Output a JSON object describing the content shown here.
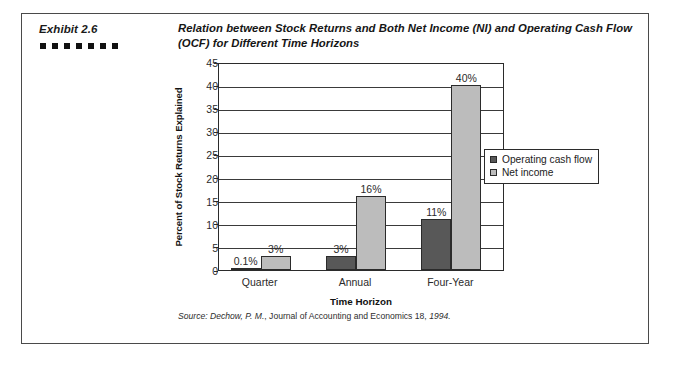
{
  "exhibit": {
    "label": "Exhibit 2.6",
    "dot_count": 7,
    "title": "Relation between Stock Returns and Both Net Income (NI) and Operating Cash Flow (OCF) for Different Time Horizons",
    "source_prefix": "Source:",
    "source_author": "Dechow, P. M.",
    "source_rest": ", Journal of Accounting and Economics 18,",
    "source_year": "1994."
  },
  "colors": {
    "operating_cash_flow": "#585858",
    "net_income": "#bcbcbc",
    "axis": "#2b2b2b",
    "frame": "#4a4a4a"
  },
  "chart_data": {
    "type": "bar",
    "title": "Relation between Stock Returns and Both Net Income (NI) and Operating Cash Flow (OCF) for Different Time Horizons",
    "xlabel": "Time Horizon",
    "ylabel": "Percent of Stock Returns Explained",
    "categories": [
      "Quarter",
      "Annual",
      "Four-Year"
    ],
    "series": [
      {
        "name": "Operating cash flow",
        "color": "#585858",
        "values": [
          0.1,
          3,
          11
        ],
        "labels": [
          "0.1%",
          "3%",
          "11%"
        ]
      },
      {
        "name": "Net income",
        "color": "#bcbcbc",
        "values": [
          3,
          16,
          40
        ],
        "labels": [
          "3%",
          "16%",
          "40%"
        ]
      }
    ],
    "ylim": [
      0,
      45
    ],
    "yticks": [
      0,
      5,
      10,
      15,
      20,
      25,
      30,
      35,
      40,
      45
    ],
    "ytick_labels": [
      "0",
      "5",
      "10",
      "15",
      "20",
      "25",
      "30",
      "35",
      "40",
      "45"
    ],
    "grid": true,
    "legend_position": "right"
  }
}
